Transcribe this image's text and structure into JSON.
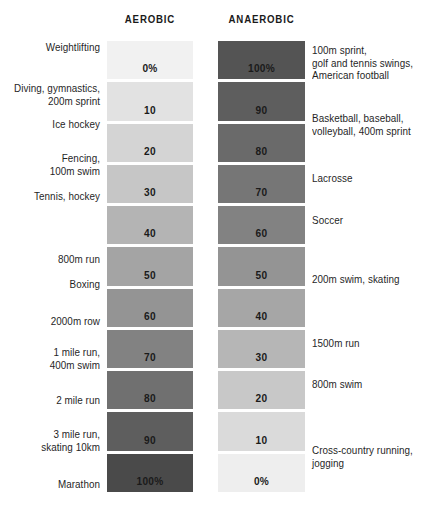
{
  "figure": {
    "headers": {
      "aerobic": "AEROBIC",
      "anaerobic": "ANAEROBIC"
    },
    "colors": {
      "text": "#1a1a1a",
      "background": "#ffffff",
      "aerobic_scale_light": "#f1f1f1",
      "aerobic_scale_dark": "#4a4a4a",
      "anaerobic_scale_light": "#f1f1f1",
      "anaerobic_scale_dark": "#4a4a4a"
    }
  },
  "chart_data": {
    "type": "table",
    "xlabel": "",
    "ylabel": "",
    "columns": [
      "Aerobic sports",
      "Aerobic %",
      "Anaerobic %",
      "Anaerobic sports"
    ],
    "categories": [
      "0",
      "10",
      "20",
      "30",
      "40",
      "50",
      "60",
      "70",
      "80",
      "90",
      "100"
    ],
    "series": [
      {
        "name": "Aerobic",
        "values": [
          0,
          10,
          20,
          30,
          40,
          50,
          60,
          70,
          80,
          90,
          100
        ]
      },
      {
        "name": "Anaerobic",
        "values": [
          100,
          90,
          80,
          70,
          60,
          50,
          40,
          30,
          20,
          10,
          0
        ]
      }
    ],
    "rows": [
      {
        "aerobic_value": "0%",
        "anaerobic_value": "100%",
        "aerobic_shade": "#f1f1f1",
        "anaerobic_shade": "#545454",
        "left_label": "Weightlifting",
        "right_label": "100m sprint,\ngolf and tennis swings,\nAmerican football"
      },
      {
        "aerobic_value": "10",
        "anaerobic_value": "90",
        "aerobic_shade": "#e2e2e2",
        "anaerobic_shade": "#5e5e5e",
        "left_label": "Diving, gymnastics,\n200m sprint",
        "right_label": ""
      },
      {
        "aerobic_value": "20",
        "anaerobic_value": "80",
        "aerobic_shade": "#d4d4d4",
        "anaerobic_shade": "#6a6a6a",
        "left_label": "Ice hockey",
        "right_label": "Basketball, baseball,\nvolleyball, 400m sprint"
      },
      {
        "aerobic_value": "30",
        "anaerobic_value": "70",
        "aerobic_shade": "#c6c6c6",
        "anaerobic_shade": "#767676",
        "left_label": "Fencing,\n100m swim",
        "right_label": ""
      },
      {
        "aerobic_value": "40",
        "anaerobic_value": "60",
        "aerobic_shade": "#b4b4b4",
        "anaerobic_shade": "#828282",
        "left_label": "Tennis, hockey",
        "right_label": "Lacrosse"
      },
      {
        "aerobic_value": "50",
        "anaerobic_value": "50",
        "aerobic_shade": "#a4a4a4",
        "anaerobic_shade": "#949494",
        "left_label": "800m run",
        "right_label": "Soccer"
      },
      {
        "aerobic_value": "60",
        "anaerobic_value": "40",
        "aerobic_shade": "#949494",
        "anaerobic_shade": "#a6a6a6",
        "left_label": "Boxing",
        "right_label": ""
      },
      {
        "aerobic_value": "70",
        "anaerobic_value": "30",
        "aerobic_shade": "#828282",
        "anaerobic_shade": "#b6b6b6",
        "left_label": "2000m row",
        "right_label": "200m swim, skating"
      },
      {
        "aerobic_value": "80",
        "anaerobic_value": "20",
        "aerobic_shade": "#707070",
        "anaerobic_shade": "#c8c8c8",
        "left_label": "1 mile run,\n400m swim",
        "right_label": "1500m run"
      },
      {
        "aerobic_value": "90",
        "anaerobic_value": "10",
        "aerobic_shade": "#5e5e5e",
        "anaerobic_shade": "#dadada",
        "left_label": "2 mile run",
        "right_label": "800m swim"
      },
      {
        "aerobic_value": "100%",
        "anaerobic_value": "0%",
        "aerobic_shade": "#4a4a4a",
        "anaerobic_shade": "#eeeeee",
        "left_label": "3 mile run,\nskating 10km",
        "right_label": "Cross-country running,\njogging"
      }
    ],
    "extra_left_label": "Marathon",
    "left_labels_positions": [
      {
        "text": "Weightlifting",
        "top": 41
      },
      {
        "text": "Diving, gymnastics,\n200m sprint",
        "top": 82
      },
      {
        "text": "Ice hockey",
        "top": 118
      },
      {
        "text": "Fencing,\n100m swim",
        "top": 152
      },
      {
        "text": "Tennis, hockey",
        "top": 190
      },
      {
        "text": "800m run",
        "top": 253
      },
      {
        "text": "Boxing",
        "top": 278
      },
      {
        "text": "2000m row",
        "top": 315
      },
      {
        "text": "1 mile run,\n400m swim",
        "top": 346
      },
      {
        "text": "2 mile run",
        "top": 394
      },
      {
        "text": "3 mile run,\nskating 10km",
        "top": 428
      },
      {
        "text": "Marathon",
        "top": 478
      }
    ],
    "right_labels_positions": [
      {
        "text": "100m sprint,\ngolf and tennis swings,\nAmerican football",
        "top": 44
      },
      {
        "text": "Basketball, baseball,\nvolleyball, 400m sprint",
        "top": 112
      },
      {
        "text": "Lacrosse",
        "top": 172
      },
      {
        "text": "Soccer",
        "top": 214
      },
      {
        "text": "200m swim, skating",
        "top": 273
      },
      {
        "text": "1500m run",
        "top": 337
      },
      {
        "text": "800m swim",
        "top": 378
      },
      {
        "text": "Cross-country running,\njogging",
        "top": 444
      }
    ],
    "grid": false,
    "legend": "none"
  }
}
